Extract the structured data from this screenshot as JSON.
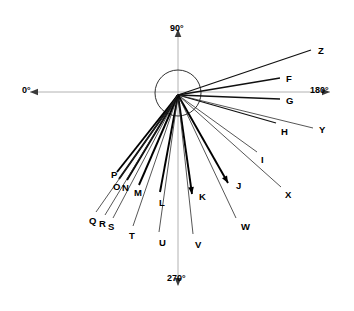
{
  "figure": {
    "type": "polar-ray-diagram",
    "background": "#ffffff",
    "line_color": "#000000",
    "axis_color": "#b2b2b2"
  },
  "axes": {
    "labels": [
      {
        "id": "axis-0",
        "text": "0°",
        "x": 22,
        "y": 86,
        "arrow": "left"
      },
      {
        "id": "axis-90",
        "text": "90°",
        "x": 170,
        "y": 24,
        "arrow": "up"
      },
      {
        "id": "axis-180",
        "text": "180°",
        "x": 310,
        "y": 86,
        "arrow": "right"
      },
      {
        "id": "axis-270",
        "text": "270°",
        "x": 167,
        "y": 274,
        "arrow": "down"
      }
    ]
  },
  "center": {
    "x": 178,
    "y": 95,
    "circle_cx": 178,
    "circle_cy": 93,
    "circle_r": 23
  },
  "chart_data": {
    "type": "scatter",
    "title": "",
    "xlabel": "",
    "ylabel": "",
    "coordinate_system": "polar",
    "angle_reference": "0° at left, 90° up, 180° right, 270° down",
    "rays": [
      {
        "label": "Z",
        "lx": 318,
        "ly": 46,
        "ex": 311,
        "ey": 50,
        "weight": "med",
        "arrow": false
      },
      {
        "label": "F",
        "lx": 286,
        "ly": 74,
        "ex": 280,
        "ey": 78,
        "weight": "med",
        "arrow": false
      },
      {
        "label": "G",
        "lx": 286,
        "ly": 96,
        "ex": 280,
        "ey": 99,
        "weight": "med",
        "arrow": false
      },
      {
        "label": "H",
        "lx": 281,
        "ly": 127,
        "ex": 276,
        "ey": 123,
        "weight": "med",
        "arrow": false
      },
      {
        "label": "Y",
        "lx": 319,
        "ly": 125,
        "ex": 313,
        "ey": 128,
        "weight": "thin",
        "arrow": false
      },
      {
        "label": "I",
        "lx": 261,
        "ly": 155,
        "ex": 257,
        "ey": 152,
        "weight": "thin",
        "arrow": false
      },
      {
        "label": "X",
        "lx": 285,
        "ly": 190,
        "ex": 281,
        "ey": 187,
        "weight": "thin",
        "arrow": false
      },
      {
        "label": "J",
        "lx": 236,
        "ly": 181,
        "ex": 228,
        "ey": 183,
        "weight": "thick",
        "arrow": true
      },
      {
        "label": "W",
        "lx": 241,
        "ly": 222,
        "ex": 236,
        "ey": 218,
        "weight": "thin",
        "arrow": false
      },
      {
        "label": "K",
        "lx": 199,
        "ly": 192,
        "ex": 192,
        "ey": 194,
        "weight": "thick",
        "arrow": true
      },
      {
        "label": "V",
        "lx": 195,
        "ly": 240,
        "ex": 193,
        "ey": 234,
        "weight": "thin",
        "arrow": false
      },
      {
        "label": "L",
        "lx": 159,
        "ly": 198,
        "ex": 160,
        "ey": 192,
        "weight": "thick",
        "arrow": false
      },
      {
        "label": "U",
        "lx": 159,
        "ly": 238,
        "ex": 159,
        "ey": 232,
        "weight": "thin",
        "arrow": false
      },
      {
        "label": "M",
        "lx": 134,
        "ly": 188,
        "ex": 139,
        "ey": 185,
        "weight": "thick",
        "arrow": false
      },
      {
        "label": "T",
        "lx": 129,
        "ly": 231,
        "ex": 133,
        "ey": 226,
        "weight": "thin",
        "arrow": false
      },
      {
        "label": "N",
        "lx": 122,
        "ly": 183,
        "ex": 127,
        "ey": 180,
        "weight": "thick",
        "arrow": false
      },
      {
        "label": "S",
        "lx": 108,
        "ly": 222,
        "ex": 113,
        "ey": 218,
        "weight": "thin",
        "arrow": false
      },
      {
        "label": "O",
        "lx": 113,
        "ly": 182,
        "ex": 119,
        "ey": 179,
        "weight": "thick",
        "arrow": false
      },
      {
        "label": "R",
        "lx": 99,
        "ly": 219,
        "ex": 105,
        "ey": 215,
        "weight": "thin",
        "arrow": false
      },
      {
        "label": "P",
        "lx": 111,
        "ly": 170,
        "ex": 117,
        "ey": 172,
        "weight": "thick",
        "arrow": false
      },
      {
        "label": "Q",
        "lx": 89,
        "ly": 216,
        "ex": 96,
        "ey": 212,
        "weight": "thin",
        "arrow": false
      }
    ]
  }
}
